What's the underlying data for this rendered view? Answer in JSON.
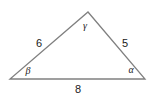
{
  "figure": {
    "type": "triangle-diagram",
    "background_color": "#ffffff",
    "stroke_color": "#808080",
    "text_color": "#1a1a1a",
    "stroke_width": 1.3,
    "width": 159,
    "height": 97
  },
  "vertices": {
    "left": {
      "name": "B",
      "x": 10,
      "y": 79
    },
    "right": {
      "name": "A",
      "x": 145,
      "y": 79
    },
    "apex": {
      "name": "C",
      "x": 88,
      "y": 12
    }
  },
  "sides": [
    {
      "id": "left-side",
      "label": "6",
      "label_x": 39,
      "label_y": 43,
      "from": "left",
      "to": "apex"
    },
    {
      "id": "right-side",
      "label": "5",
      "label_x": 125,
      "label_y": 43,
      "from": "apex",
      "to": "right"
    },
    {
      "id": "base-side",
      "label": "8",
      "label_x": 78,
      "label_y": 89,
      "from": "left",
      "to": "right"
    }
  ],
  "angles": [
    {
      "id": "angle-beta",
      "label": "β",
      "label_x": 28,
      "label_y": 71,
      "vertex": "left"
    },
    {
      "id": "angle-alpha",
      "label": "α",
      "label_x": 131,
      "label_y": 70,
      "vertex": "right"
    },
    {
      "id": "angle-gamma",
      "label": "γ",
      "label_x": 85,
      "label_y": 26,
      "vertex": "apex"
    }
  ],
  "chart_data": {
    "type": "diagram",
    "title": "",
    "shape": "triangle",
    "side_lengths": {
      "a": 5,
      "b": 6,
      "c": 8
    },
    "side_labels": [
      "6",
      "5",
      "8"
    ],
    "angle_labels": [
      "β",
      "α",
      "γ"
    ],
    "points": [
      [
        10,
        79
      ],
      [
        145,
        79
      ],
      [
        88,
        12
      ]
    ]
  }
}
